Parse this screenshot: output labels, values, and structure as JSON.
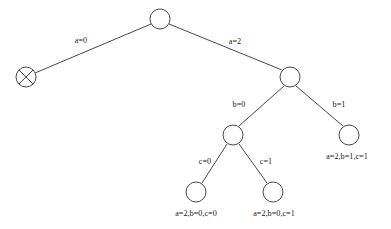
{
  "figure": {
    "kind": "search-tree-diagram",
    "width": 391,
    "height": 229,
    "background_color": "#ffffff",
    "stroke_color": "#333333",
    "text_color": "#1a1a1a"
  },
  "nodes": {
    "root": {
      "id": "root",
      "cx": 160,
      "cy": 19,
      "r": 10,
      "type": "open"
    },
    "failed": {
      "id": "failed",
      "cx": 26,
      "cy": 77,
      "r": 10,
      "type": "crossed"
    },
    "a2": {
      "id": "a2",
      "cx": 290,
      "cy": 77,
      "r": 10,
      "type": "open"
    },
    "a2b0": {
      "id": "a2b0",
      "cx": 233,
      "cy": 135,
      "r": 10,
      "type": "open"
    },
    "a2b1c1": {
      "id": "a2b1c1",
      "cx": 349,
      "cy": 135,
      "r": 10,
      "type": "open"
    },
    "a2b0c0": {
      "id": "a2b0c0",
      "cx": 196,
      "cy": 192,
      "r": 10,
      "type": "open"
    },
    "a2b0c1": {
      "id": "a2b0c1",
      "cx": 273,
      "cy": 192,
      "r": 10,
      "type": "open"
    }
  },
  "edges": [
    {
      "id": "edge-a0",
      "from": "root",
      "to": "failed",
      "x1": 151,
      "y1": 24,
      "x2": 35,
      "y2": 73
    },
    {
      "id": "edge-a2",
      "from": "root",
      "to": "a2",
      "x1": 169,
      "y1": 24,
      "x2": 282,
      "y2": 70
    },
    {
      "id": "edge-b0",
      "from": "a2",
      "to": "a2b0",
      "x1": 284,
      "y1": 86,
      "x2": 239,
      "y2": 126
    },
    {
      "id": "edge-b1",
      "from": "a2",
      "to": "a2b1c1",
      "x1": 296,
      "y1": 86,
      "x2": 343,
      "y2": 126
    },
    {
      "id": "edge-c0",
      "from": "a2b0",
      "to": "a2b0c0",
      "x1": 227,
      "y1": 144,
      "x2": 202,
      "y2": 183
    },
    {
      "id": "edge-c1",
      "from": "a2b0",
      "to": "a2b0c1",
      "x1": 239,
      "y1": 144,
      "x2": 267,
      "y2": 183
    }
  ],
  "edge_labels": [
    {
      "id": "label-a0",
      "text": "a=0",
      "x": 81,
      "y": 41
    },
    {
      "id": "label-a2",
      "text": "a=2",
      "x": 235,
      "y": 42
    },
    {
      "id": "label-b0",
      "text": "b=0",
      "x": 239,
      "y": 105
    },
    {
      "id": "label-b1",
      "text": "b=1",
      "x": 339,
      "y": 105
    },
    {
      "id": "label-c0",
      "text": "c=0",
      "x": 205,
      "y": 162
    },
    {
      "id": "label-c1",
      "text": "c=1",
      "x": 266,
      "y": 162
    }
  ],
  "leaf_labels": [
    {
      "id": "leaf-label-a2b1c1",
      "text": "a=2,b=1,c=1",
      "x": 347,
      "y": 157
    },
    {
      "id": "leaf-label-a2b0c0",
      "text": "a=2,b=0,c=0",
      "x": 196,
      "y": 214
    },
    {
      "id": "leaf-label-a2b0c1",
      "text": "a=2,b=0,c=1",
      "x": 274,
      "y": 214
    }
  ]
}
